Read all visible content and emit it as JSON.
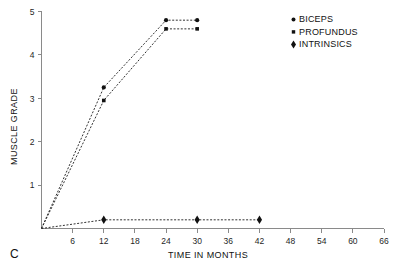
{
  "panel": {
    "label": "C"
  },
  "chart_data": {
    "type": "line",
    "title": "",
    "xlabel": "TIME IN MONTHS",
    "ylabel": "MUSCLE GRADE",
    "xlim": [
      0,
      66
    ],
    "ylim": [
      0,
      5
    ],
    "xticks": [
      6,
      12,
      18,
      24,
      30,
      36,
      42,
      48,
      54,
      60,
      66
    ],
    "xtick_labels": [
      "6",
      "12",
      "18",
      "24",
      "30",
      "36",
      "42",
      "48",
      "54",
      "60",
      "66"
    ],
    "yticks": [
      1,
      2,
      3,
      4,
      5
    ],
    "ytick_labels": [
      "1",
      "2",
      "3",
      "4",
      "5"
    ],
    "grid": false,
    "legend_position": "top-right",
    "line_style": "dashed",
    "series": [
      {
        "name": "BICEPS",
        "marker": "circle",
        "color": "#111111",
        "x": [
          0,
          12,
          24,
          30
        ],
        "values": [
          0,
          3.25,
          4.8,
          4.8
        ]
      },
      {
        "name": "PROFUNDUS",
        "marker": "square",
        "color": "#111111",
        "x": [
          0,
          12,
          24,
          30
        ],
        "values": [
          0,
          2.95,
          4.6,
          4.6
        ]
      },
      {
        "name": "INTRINSICS",
        "marker": "diamond",
        "color": "#111111",
        "x": [
          0,
          12,
          30,
          42
        ],
        "values": [
          0,
          0.2,
          0.2,
          0.2
        ]
      }
    ]
  },
  "legend": {
    "entries": [
      {
        "label": "BICEPS",
        "marker": "circle"
      },
      {
        "label": "PROFUNDUS",
        "marker": "square"
      },
      {
        "label": "INTRINSICS",
        "marker": "diamond"
      }
    ]
  }
}
